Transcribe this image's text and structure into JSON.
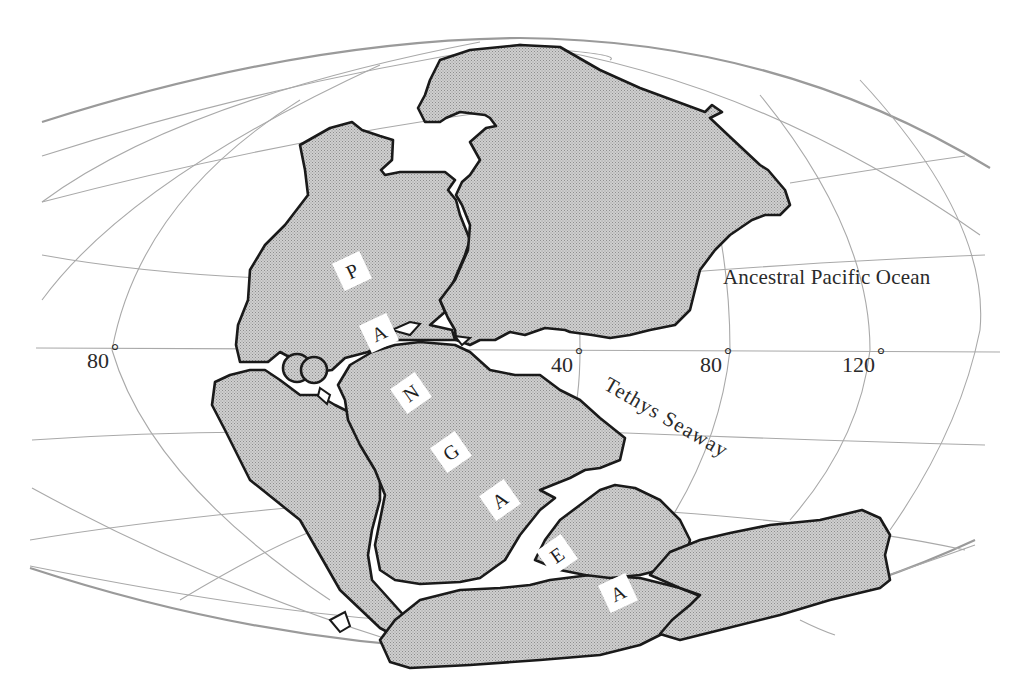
{
  "map": {
    "title": "Pangaea supercontinent",
    "colors": {
      "land_fill": "#c9c9c9",
      "land_outline": "#1a1a1a",
      "graticule": "#a9a9a9",
      "ocean": "#ffffff",
      "text": "#2a2a2a"
    },
    "labels": {
      "ocean": "Ancestral Pacific Ocean",
      "seaway": "Tethys Seaway"
    },
    "supercontinent_letters": [
      "P",
      "A",
      "N",
      "G",
      "A",
      "E",
      "A"
    ],
    "longitude_labels": [
      {
        "value": "80",
        "unit": "°"
      },
      {
        "value": "40",
        "unit": "°"
      },
      {
        "value": "80",
        "unit": "°"
      },
      {
        "value": "120",
        "unit": "°"
      }
    ]
  }
}
